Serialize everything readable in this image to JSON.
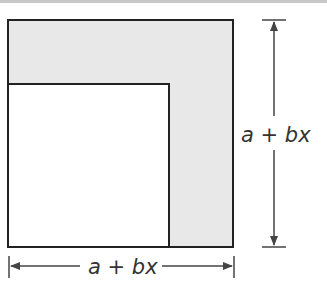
{
  "diagram": {
    "type": "geometry-figure",
    "outer_side_label": "a + bx",
    "vertical_label": "a + bx",
    "horizontal_label": "a + bx",
    "colors": {
      "shaded_region": "#e8e8e8",
      "inner_square": "#ffffff",
      "stroke": "#222222",
      "dimension_lines": "#444444"
    }
  }
}
